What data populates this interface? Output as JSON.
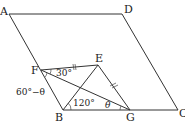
{
  "diagram": {
    "type": "geometry",
    "shape": "parallelogram ABCD with inner triangles",
    "points": {
      "A": {
        "label": "A",
        "x": 9,
        "y": 14
      },
      "D": {
        "label": "D",
        "x": 122,
        "y": 14
      },
      "C": {
        "label": "C",
        "x": 178,
        "y": 110
      },
      "B": {
        "label": "B",
        "x": 63,
        "y": 110
      },
      "F": {
        "label": "F",
        "x": 41,
        "y": 70
      },
      "E": {
        "label": "E",
        "x": 98,
        "y": 65
      },
      "G": {
        "label": "G",
        "x": 130,
        "y": 110
      }
    },
    "segments": [
      "AD",
      "DC",
      "CB",
      "BA",
      "FE",
      "FG",
      "EB",
      "EG"
    ],
    "angle_labels": {
      "efg": "30°",
      "bfg": "60°−θ",
      "ebg": "120°",
      "fgb": "θ"
    },
    "tick_marks": {
      "FE": "||",
      "EG": "||"
    }
  }
}
